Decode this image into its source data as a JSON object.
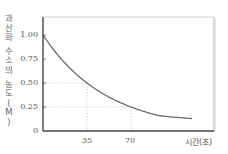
{
  "chart_data": {
    "type": "line",
    "title": "",
    "xlabel": "시간(초)",
    "ylabel": "과산화 수소의 농도(M)",
    "x_ticks": [
      "35",
      "70"
    ],
    "y_ticks": [
      "0",
      "0.25",
      "0.50",
      "0.75",
      "1.00"
    ],
    "xlim": [
      0,
      136
    ],
    "ylim": [
      0,
      1.17
    ],
    "grid": false,
    "guide_lines": [
      {
        "x": 35,
        "y": 0.5,
        "style": "dotted"
      },
      {
        "x": 70,
        "y": 0.25,
        "style": "dotted"
      }
    ],
    "series": [
      {
        "name": "H2O2 concentration",
        "x": [
          0,
          13.5,
          35,
          53,
          70,
          93,
          118.5
        ],
        "y": [
          1.0,
          0.77,
          0.5,
          0.34,
          0.26,
          0.19,
          0.146
        ]
      }
    ],
    "half_life_s": 35,
    "colors": {
      "curve": "#6b6b6b",
      "axis": "#444444",
      "frame": "#cccccc",
      "guide": "#cfcfcf"
    }
  },
  "labels": {
    "ylabel_chars": [
      "과",
      "산",
      "화",
      "",
      "수",
      "소",
      "의",
      "",
      "농",
      "도",
      "(",
      "M",
      ")"
    ],
    "xlabel": "시간(초)",
    "y_ticks": {
      "t0": "0",
      "t025": "0.25",
      "t050": "0.50",
      "t075": "0.75",
      "t100": "1.00"
    },
    "x_ticks": {
      "t35": "35",
      "t70": "70"
    }
  }
}
